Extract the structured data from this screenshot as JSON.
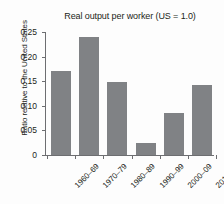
{
  "chart_data": {
    "type": "bar",
    "title": "Real output per worker (US = 1.0)",
    "xlabel": "",
    "ylabel": "Ratio relative to the United States",
    "categories": [
      "1960–69",
      "1970–79",
      "1980–89",
      "1990–99",
      "2000–09",
      "2010–17"
    ],
    "values": [
      0.17,
      0.24,
      0.148,
      0.025,
      0.085,
      0.142
    ],
    "ylim": [
      0,
      0.25
    ],
    "ytick_values": [
      0,
      0.05,
      0.1,
      0.15,
      0.2,
      0.25
    ],
    "ytick_labels": [
      "0",
      "0.05",
      "0.10",
      "0.15",
      "0.20",
      "0.25"
    ],
    "grid": false,
    "legend": false,
    "bar_color": "#808285",
    "axis_color": "#6d6e71",
    "text_color": "#231f20",
    "background_color": "#fdfdfd"
  }
}
